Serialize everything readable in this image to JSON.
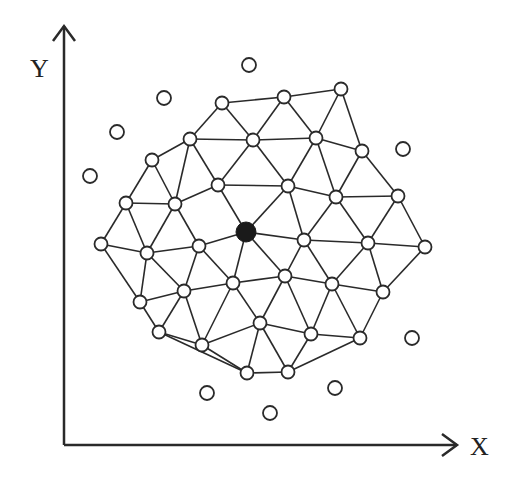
{
  "axes": {
    "x_label": "X",
    "y_label": "Y",
    "origin": [
      64,
      445
    ],
    "x_end": [
      457,
      445
    ],
    "y_end": [
      64,
      26
    ]
  },
  "colors": {
    "line": "#2a2a2a",
    "node_fill": "#ffffff",
    "center_fill": "#1a1a1a"
  },
  "center_node": "R",
  "nodes": {
    "A": [
      222,
      103
    ],
    "B": [
      284,
      97
    ],
    "C": [
      341,
      89
    ],
    "D": [
      190,
      139
    ],
    "E": [
      253,
      140
    ],
    "F": [
      316,
      138
    ],
    "G": [
      362,
      151
    ],
    "H": [
      152,
      160
    ],
    "I": [
      218,
      185
    ],
    "J": [
      288,
      186
    ],
    "K": [
      336,
      197
    ],
    "L": [
      398,
      196
    ],
    "M": [
      126,
      203
    ],
    "N": [
      175,
      204
    ],
    "O": [
      101,
      244
    ],
    "P": [
      147,
      253
    ],
    "Q": [
      199,
      246
    ],
    "R": [
      246,
      232
    ],
    "S": [
      304,
      240
    ],
    "T": [
      368,
      243
    ],
    "U": [
      425,
      247
    ],
    "V": [
      184,
      291
    ],
    "W": [
      233,
      283
    ],
    "X": [
      285,
      276
    ],
    "Y": [
      332,
      284
    ],
    "Z": [
      383,
      292
    ],
    "a": [
      140,
      302
    ],
    "b": [
      159,
      332
    ],
    "c": [
      202,
      345
    ],
    "d": [
      260,
      323
    ],
    "e": [
      311,
      334
    ],
    "f": [
      360,
      338
    ],
    "g": [
      247,
      373
    ],
    "h": [
      288,
      372
    ]
  },
  "isolated_nodes": [
    [
      249,
      65
    ],
    [
      164,
      98
    ],
    [
      117,
      132
    ],
    [
      90,
      176
    ],
    [
      403,
      149
    ],
    [
      412,
      338
    ],
    [
      207,
      393
    ],
    [
      270,
      413
    ],
    [
      335,
      388
    ]
  ],
  "edges": [
    [
      "A",
      "B"
    ],
    [
      "B",
      "C"
    ],
    [
      "A",
      "D"
    ],
    [
      "A",
      "E"
    ],
    [
      "B",
      "E"
    ],
    [
      "B",
      "F"
    ],
    [
      "C",
      "F"
    ],
    [
      "C",
      "G"
    ],
    [
      "D",
      "E"
    ],
    [
      "E",
      "F"
    ],
    [
      "F",
      "G"
    ],
    [
      "D",
      "H"
    ],
    [
      "D",
      "I"
    ],
    [
      "D",
      "N"
    ],
    [
      "E",
      "I"
    ],
    [
      "E",
      "J"
    ],
    [
      "F",
      "J"
    ],
    [
      "F",
      "K"
    ],
    [
      "G",
      "K"
    ],
    [
      "G",
      "L"
    ],
    [
      "I",
      "J"
    ],
    [
      "J",
      "K"
    ],
    [
      "K",
      "L"
    ],
    [
      "H",
      "M"
    ],
    [
      "H",
      "N"
    ],
    [
      "I",
      "N"
    ],
    [
      "I",
      "R"
    ],
    [
      "J",
      "R"
    ],
    [
      "J",
      "S"
    ],
    [
      "K",
      "S"
    ],
    [
      "K",
      "T"
    ],
    [
      "L",
      "T"
    ],
    [
      "L",
      "U"
    ],
    [
      "M",
      "N"
    ],
    [
      "M",
      "O"
    ],
    [
      "M",
      "P"
    ],
    [
      "N",
      "P"
    ],
    [
      "N",
      "Q"
    ],
    [
      "O",
      "P"
    ],
    [
      "P",
      "Q"
    ],
    [
      "Q",
      "R"
    ],
    [
      "R",
      "S"
    ],
    [
      "S",
      "T"
    ],
    [
      "T",
      "U"
    ],
    [
      "O",
      "a"
    ],
    [
      "P",
      "a"
    ],
    [
      "P",
      "V"
    ],
    [
      "Q",
      "V"
    ],
    [
      "Q",
      "W"
    ],
    [
      "R",
      "W"
    ],
    [
      "R",
      "X"
    ],
    [
      "S",
      "X"
    ],
    [
      "S",
      "Y"
    ],
    [
      "T",
      "Y"
    ],
    [
      "T",
      "Z"
    ],
    [
      "U",
      "Z"
    ],
    [
      "a",
      "V"
    ],
    [
      "V",
      "W"
    ],
    [
      "W",
      "X"
    ],
    [
      "X",
      "Y"
    ],
    [
      "Y",
      "Z"
    ],
    [
      "a",
      "b"
    ],
    [
      "V",
      "b"
    ],
    [
      "V",
      "c"
    ],
    [
      "W",
      "c"
    ],
    [
      "W",
      "d"
    ],
    [
      "X",
      "d"
    ],
    [
      "X",
      "e"
    ],
    [
      "Y",
      "e"
    ],
    [
      "Y",
      "f"
    ],
    [
      "Z",
      "f"
    ],
    [
      "b",
      "c"
    ],
    [
      "c",
      "d"
    ],
    [
      "d",
      "e"
    ],
    [
      "e",
      "f"
    ],
    [
      "b",
      "g"
    ],
    [
      "c",
      "g"
    ],
    [
      "d",
      "g"
    ],
    [
      "d",
      "h"
    ],
    [
      "e",
      "h"
    ],
    [
      "f",
      "h"
    ],
    [
      "g",
      "h"
    ]
  ]
}
